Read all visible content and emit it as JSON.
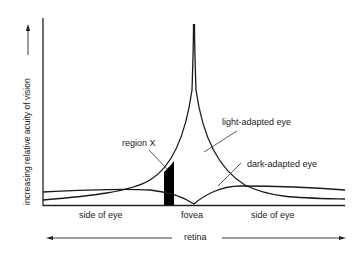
{
  "diagram": {
    "y_axis_label": "increasing relative acuity of vision",
    "x_axis_label": "retina",
    "labels": {
      "left_side": "side of eye",
      "center": "fovea",
      "right_side": "side of eye",
      "light_curve": "light-adapted eye",
      "dark_curve": "dark-adapted eye",
      "region": "region X"
    },
    "colors": {
      "line": "#1a1a1a",
      "region_fill": "#000000",
      "background": "#ffffff"
    }
  }
}
